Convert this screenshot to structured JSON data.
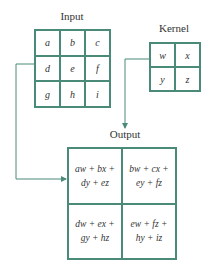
{
  "diagram": {
    "colors": {
      "border": "#4a8a78",
      "text": "#333333"
    },
    "input": {
      "title": "Input",
      "cells": [
        "a",
        "b",
        "c",
        "d",
        "e",
        "f",
        "g",
        "h",
        "i"
      ]
    },
    "kernel": {
      "title": "Kernel",
      "cells": [
        "w",
        "x",
        "y",
        "z"
      ]
    },
    "output": {
      "title": "Output",
      "cells": [
        {
          "line1": "aw + bx +",
          "line2": "dy + ez"
        },
        {
          "line1": "bw + cx +",
          "line2": "ey + fz"
        },
        {
          "line1": "dw + ex +",
          "line2": "gy + hz"
        },
        {
          "line1": "ew + fz +",
          "line2": "hy + iz"
        }
      ]
    },
    "connectors": [
      {
        "from": "input",
        "to": "output"
      },
      {
        "from": "kernel",
        "to": "output"
      }
    ]
  }
}
